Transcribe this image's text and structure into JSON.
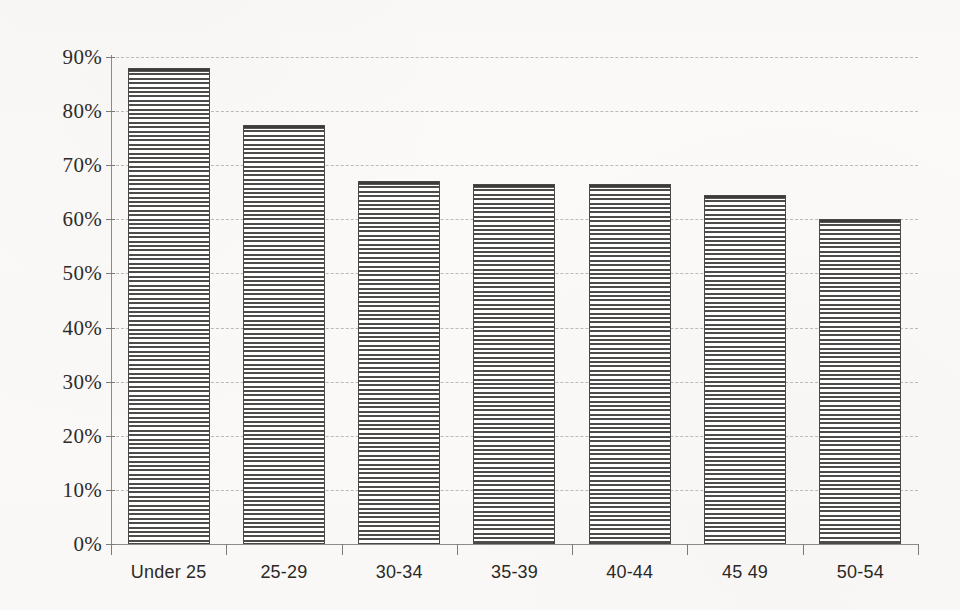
{
  "chart_data": {
    "type": "bar",
    "title": "",
    "subtitle": "",
    "xlabel": "",
    "ylabel": "",
    "categories": [
      "Under 25",
      "25-29",
      "30-34",
      "35-39",
      "40-44",
      "45 49",
      "50-54"
    ],
    "values": [
      88,
      77.5,
      67,
      66.5,
      66.5,
      64.5,
      60
    ],
    "value_labels": [
      "88%",
      "77.5%",
      "67%",
      "66.5%",
      "66.5%",
      "64.5%",
      "60%"
    ],
    "ylim": [
      0,
      90
    ],
    "ytick_labels": [
      "0%",
      "10%",
      "20%",
      "30%",
      "40%",
      "50%",
      "60%",
      "70%",
      "80%",
      "90%"
    ],
    "ytick_values": [
      0,
      10,
      20,
      30,
      40,
      50,
      60,
      70,
      80,
      90
    ],
    "grid": "horizontal-dashed",
    "legend": "none",
    "series": [
      {
        "name": "",
        "values": [
          88,
          77.5,
          67,
          66.5,
          66.5,
          64.5,
          60
        ],
        "fill": "horizontal-stripes",
        "fill_color": "#4e4c4a",
        "border_color": "#4a4846"
      }
    ]
  },
  "style": {
    "background_color": "#fbfaf8",
    "axis_color": "#8d8b88",
    "grid_color": "#b9b7b4",
    "text_color": "#2b2927"
  }
}
